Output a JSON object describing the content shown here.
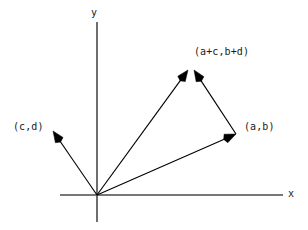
{
  "figure": {
    "type": "vector-addition-diagram",
    "width": 308,
    "height": 230,
    "background_color": "#ffffff",
    "stroke_color": "#000000",
    "axis_color": "#4a4a4a"
  },
  "axes": {
    "origin": {
      "x": 97,
      "y": 195
    },
    "x_axis": {
      "label": "x",
      "label_x": 288,
      "label_y": 188,
      "start": {
        "x": 60,
        "y": 195
      },
      "end": {
        "x": 283,
        "y": 195
      }
    },
    "y_axis": {
      "label": "y",
      "label_x": 91,
      "label_y": 7,
      "start": {
        "x": 97,
        "y": 22
      },
      "end": {
        "x": 97,
        "y": 222
      }
    }
  },
  "vectors": [
    {
      "name": "vector-a-b",
      "label": "(a,b)",
      "label_x": 244,
      "label_y": 121,
      "from": {
        "x": 97,
        "y": 195
      },
      "to": {
        "x": 236,
        "y": 134
      },
      "head_size": 11
    },
    {
      "name": "vector-c-d",
      "label": "(c,d)",
      "label_x": 13,
      "label_y": 121,
      "from": {
        "x": 97,
        "y": 195
      },
      "to": {
        "x": 53,
        "y": 131
      },
      "head_size": 11
    },
    {
      "name": "vector-sum",
      "label": "(a+c,b+d)",
      "label_x": 194,
      "label_y": 46,
      "from": {
        "x": 97,
        "y": 195
      },
      "to": {
        "x": 188,
        "y": 70
      },
      "head_size": 11
    },
    {
      "name": "vector-c-d-translated",
      "label": "",
      "from": {
        "x": 236,
        "y": 134
      },
      "to": {
        "x": 194,
        "y": 70
      },
      "head_size": 11
    }
  ]
}
